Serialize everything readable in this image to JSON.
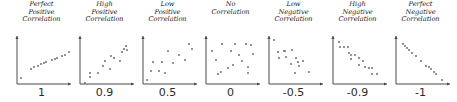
{
  "colors": {
    "axis": "#4a4a4a",
    "point": "#707070",
    "text": "#1a1a1a"
  },
  "chart_data": {
    "type": "scatter",
    "title": "",
    "panels": [
      {
        "title": "Perfect\nPositive\nCorrelation",
        "label": "1",
        "points": [
          [
            4,
            42
          ],
          [
            14,
            33
          ],
          [
            17,
            31
          ],
          [
            21,
            30
          ],
          [
            24,
            28
          ],
          [
            27,
            27
          ],
          [
            29,
            26
          ],
          [
            35,
            24
          ],
          [
            38,
            23
          ],
          [
            40,
            22
          ],
          [
            45,
            20
          ],
          [
            48,
            19
          ],
          [
            52,
            16
          ]
        ]
      },
      {
        "title": "High\nPositive\nCorrelation",
        "label": "0.9",
        "points": [
          [
            5,
            47
          ],
          [
            10,
            41
          ],
          [
            10,
            37
          ],
          [
            18,
            37
          ],
          [
            23,
            30
          ],
          [
            25,
            25
          ],
          [
            30,
            33
          ],
          [
            31,
            20
          ],
          [
            34,
            22
          ],
          [
            40,
            25
          ],
          [
            42,
            16
          ],
          [
            44,
            13
          ],
          [
            46,
            10
          ],
          [
            47,
            14
          ]
        ]
      },
      {
        "title": "Low\nPositive\nCorrelation",
        "label": "0.5",
        "points": [
          [
            4,
            44
          ],
          [
            8,
            35
          ],
          [
            10,
            26
          ],
          [
            16,
            35
          ],
          [
            19,
            26
          ],
          [
            22,
            37
          ],
          [
            25,
            15
          ],
          [
            30,
            27
          ],
          [
            36,
            19
          ],
          [
            42,
            24
          ],
          [
            46,
            8
          ],
          [
            49,
            13
          ]
        ]
      },
      {
        "title": "No\nCorrelation",
        "label": "0",
        "points": [
          [
            6,
            15
          ],
          [
            10,
            24
          ],
          [
            12,
            38
          ],
          [
            15,
            36
          ],
          [
            16,
            8
          ],
          [
            22,
            32
          ],
          [
            25,
            15
          ],
          [
            27,
            29
          ],
          [
            29,
            8
          ],
          [
            33,
            19
          ],
          [
            36,
            25
          ],
          [
            40,
            8
          ],
          [
            42,
            31
          ],
          [
            42,
            37
          ],
          [
            45,
            9
          ],
          [
            47,
            18
          ]
        ]
      },
      {
        "title": "Low\nNegative\nCorrelation",
        "label": "-0.5",
        "points": [
          [
            5,
            4
          ],
          [
            9,
            16
          ],
          [
            10,
            22
          ],
          [
            15,
            15
          ],
          [
            16,
            15
          ],
          [
            17,
            21
          ],
          [
            22,
            28
          ],
          [
            23,
            14
          ],
          [
            26,
            37
          ],
          [
            27,
            22
          ],
          [
            29,
            26
          ],
          [
            30,
            30
          ],
          [
            34,
            25
          ],
          [
            40,
            36
          ]
        ]
      },
      {
        "title": "High\nNegative\nCorrelation",
        "label": "-0.9",
        "points": [
          [
            6,
            6
          ],
          [
            7,
            11
          ],
          [
            11,
            11
          ],
          [
            15,
            11
          ],
          [
            16,
            17
          ],
          [
            18,
            19
          ],
          [
            18,
            23
          ],
          [
            22,
            19
          ],
          [
            26,
            22
          ],
          [
            26,
            29
          ],
          [
            30,
            25
          ],
          [
            32,
            31
          ],
          [
            36,
            32
          ],
          [
            39,
            32
          ],
          [
            39,
            38
          ],
          [
            44,
            38
          ]
        ]
      },
      {
        "title": "Perfect\nNegative\nCorrelation",
        "label": "-1",
        "points": [
          [
            7,
            8
          ],
          [
            9,
            10
          ],
          [
            11,
            12
          ],
          [
            13,
            14
          ],
          [
            16,
            17
          ],
          [
            20,
            20
          ],
          [
            25,
            25
          ],
          [
            30,
            30
          ],
          [
            33,
            31
          ],
          [
            35,
            33
          ],
          [
            38,
            36
          ],
          [
            40,
            38
          ],
          [
            46,
            44
          ]
        ]
      }
    ]
  }
}
